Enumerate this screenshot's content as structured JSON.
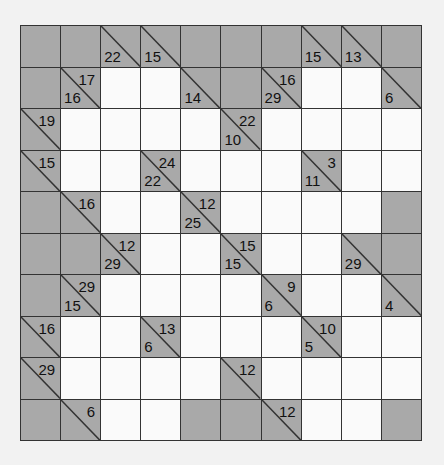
{
  "puzzle": {
    "type": "kakuro",
    "rows": 10,
    "cols": 10,
    "colors": {
      "block": "#a9a9a9",
      "entry": "#fafafa",
      "line": "#333333"
    },
    "grid": [
      [
        {
          "t": "B"
        },
        {
          "t": "B"
        },
        {
          "t": "D",
          "down": "22"
        },
        {
          "t": "D",
          "down": "15"
        },
        {
          "t": "B"
        },
        {
          "t": "B"
        },
        {
          "t": "B"
        },
        {
          "t": "D",
          "down": "15"
        },
        {
          "t": "D",
          "down": "13"
        },
        {
          "t": "B"
        }
      ],
      [
        {
          "t": "B"
        },
        {
          "t": "D",
          "across": "17",
          "down": "16"
        },
        {
          "t": "W"
        },
        {
          "t": "W"
        },
        {
          "t": "D",
          "down": "14"
        },
        {
          "t": "B"
        },
        {
          "t": "D",
          "across": "16",
          "down": "29"
        },
        {
          "t": "W"
        },
        {
          "t": "W"
        },
        {
          "t": "D",
          "down": "6"
        }
      ],
      [
        {
          "t": "D",
          "across": "19"
        },
        {
          "t": "W"
        },
        {
          "t": "W"
        },
        {
          "t": "W"
        },
        {
          "t": "W"
        },
        {
          "t": "D",
          "across": "22",
          "down": "10"
        },
        {
          "t": "W"
        },
        {
          "t": "W"
        },
        {
          "t": "W"
        },
        {
          "t": "W"
        }
      ],
      [
        {
          "t": "D",
          "across": "15"
        },
        {
          "t": "W"
        },
        {
          "t": "W"
        },
        {
          "t": "D",
          "across": "24",
          "down": "22"
        },
        {
          "t": "W"
        },
        {
          "t": "W"
        },
        {
          "t": "W"
        },
        {
          "t": "D",
          "across": "3",
          "down": "11"
        },
        {
          "t": "W"
        },
        {
          "t": "W"
        }
      ],
      [
        {
          "t": "B"
        },
        {
          "t": "D",
          "across": "16"
        },
        {
          "t": "W"
        },
        {
          "t": "W"
        },
        {
          "t": "D",
          "across": "12",
          "down": "25"
        },
        {
          "t": "W"
        },
        {
          "t": "W"
        },
        {
          "t": "W"
        },
        {
          "t": "W"
        },
        {
          "t": "B"
        }
      ],
      [
        {
          "t": "B"
        },
        {
          "t": "B"
        },
        {
          "t": "D",
          "across": "12",
          "down": "29"
        },
        {
          "t": "W"
        },
        {
          "t": "W"
        },
        {
          "t": "D",
          "across": "15",
          "down": "15"
        },
        {
          "t": "W"
        },
        {
          "t": "W"
        },
        {
          "t": "D",
          "down": "29"
        },
        {
          "t": "B"
        }
      ],
      [
        {
          "t": "B"
        },
        {
          "t": "D",
          "across": "29",
          "down": "15"
        },
        {
          "t": "W"
        },
        {
          "t": "W"
        },
        {
          "t": "W"
        },
        {
          "t": "W"
        },
        {
          "t": "D",
          "across": "9",
          "down": "6"
        },
        {
          "t": "W"
        },
        {
          "t": "W"
        },
        {
          "t": "D",
          "down": "4"
        }
      ],
      [
        {
          "t": "D",
          "across": "16"
        },
        {
          "t": "W"
        },
        {
          "t": "W"
        },
        {
          "t": "D",
          "across": "13",
          "down": "6"
        },
        {
          "t": "W"
        },
        {
          "t": "W"
        },
        {
          "t": "W"
        },
        {
          "t": "D",
          "across": "10",
          "down": "5"
        },
        {
          "t": "W"
        },
        {
          "t": "W"
        }
      ],
      [
        {
          "t": "D",
          "across": "29"
        },
        {
          "t": "W"
        },
        {
          "t": "W"
        },
        {
          "t": "W"
        },
        {
          "t": "W"
        },
        {
          "t": "D",
          "across": "12"
        },
        {
          "t": "W"
        },
        {
          "t": "W"
        },
        {
          "t": "W"
        },
        {
          "t": "W"
        }
      ],
      [
        {
          "t": "B"
        },
        {
          "t": "D",
          "across": "6"
        },
        {
          "t": "W"
        },
        {
          "t": "W"
        },
        {
          "t": "B"
        },
        {
          "t": "B"
        },
        {
          "t": "D",
          "across": "12"
        },
        {
          "t": "W"
        },
        {
          "t": "W"
        },
        {
          "t": "B"
        }
      ]
    ]
  }
}
